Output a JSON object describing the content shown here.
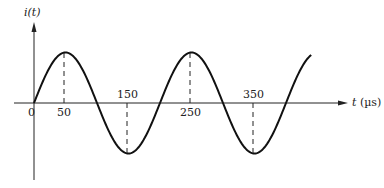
{
  "chart_data": {
    "type": "line",
    "title": "",
    "xlabel": "t (µs)",
    "ylabel": "i(t)",
    "x_tick_labels": [
      "0",
      "50",
      "150",
      "250",
      "350"
    ],
    "peaks_t": [
      50,
      250
    ],
    "troughs_t": [
      150,
      350
    ],
    "period_us": 200,
    "t_range": [
      0,
      440
    ],
    "series": [
      {
        "name": "i(t)",
        "x": [
          0,
          25,
          50,
          75,
          100,
          125,
          150,
          175,
          200,
          225,
          250,
          275,
          300,
          325,
          350,
          375,
          400,
          425,
          440
        ],
        "values": [
          0,
          0.707,
          1,
          0.707,
          0,
          -0.707,
          -1,
          -0.707,
          0,
          0.707,
          1,
          0.707,
          0,
          -0.707,
          -1,
          -0.707,
          0,
          0.707,
          0.951
        ]
      }
    ],
    "grid": false,
    "legend": null
  },
  "labels": {
    "y_axis": "i(t)",
    "x_axis": "t (µs)",
    "tick_0": "0",
    "tick_50": "50",
    "tick_150": "150",
    "tick_250": "250",
    "tick_350": "350"
  }
}
